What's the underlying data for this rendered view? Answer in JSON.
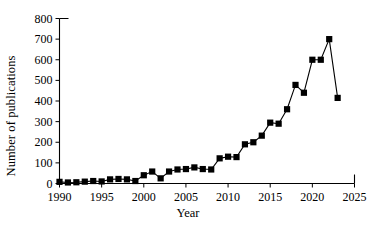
{
  "chart_data": {
    "type": "line",
    "title": "",
    "xlabel": "Year",
    "ylabel": "Number of publications",
    "xlim": [
      1990,
      2025
    ],
    "ylim": [
      0,
      800
    ],
    "xticks": [
      1990,
      1995,
      2000,
      2005,
      2010,
      2015,
      2020,
      2025
    ],
    "yticks": [
      0,
      100,
      200,
      300,
      400,
      500,
      600,
      700,
      800
    ],
    "grid": false,
    "legend": "none",
    "marker": "filled-square",
    "series": [
      {
        "name": "Number of publications",
        "color": "#000000",
        "x": [
          1990,
          1991,
          1992,
          1993,
          1994,
          1995,
          1996,
          1997,
          1998,
          1999,
          2000,
          2001,
          2002,
          2003,
          2004,
          2005,
          2006,
          2007,
          2008,
          2009,
          2010,
          2011,
          2012,
          2013,
          2014,
          2015,
          2016,
          2017,
          2018,
          2019,
          2020,
          2021,
          2022,
          2023
        ],
        "values": [
          8,
          5,
          6,
          9,
          12,
          10,
          20,
          22,
          20,
          12,
          40,
          58,
          25,
          58,
          68,
          70,
          78,
          70,
          68,
          122,
          130,
          128,
          190,
          200,
          232,
          295,
          290,
          360,
          478,
          440,
          600,
          600,
          700,
          415
        ]
      }
    ]
  },
  "axis_labels": {
    "x": "Year",
    "y": "Number of publications"
  }
}
